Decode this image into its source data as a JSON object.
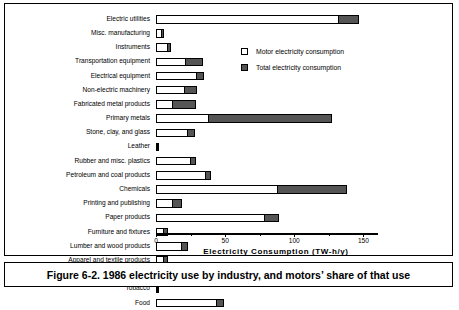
{
  "caption": "Figure 6-2. 1986 electricity use by industry, and motors’ share of that use",
  "legend": {
    "items": [
      {
        "label": "Motor electricity consumption",
        "swatch": "white-square",
        "color": "#ffffff"
      },
      {
        "label": "Total electricity consumption",
        "swatch": "dark-square",
        "color": "#555555"
      }
    ]
  },
  "chart_data": {
    "type": "bar",
    "orientation": "horizontal",
    "title": "",
    "xlabel": "Electricity  Consumption  (TW-h/y)",
    "ylabel": "",
    "xlim": [
      0,
      160
    ],
    "xticks": [
      0,
      50,
      100,
      150
    ],
    "xticklabels": [
      "0",
      "50",
      "100",
      "150"
    ],
    "grid": false,
    "legend_position": "upper-right-inside",
    "categories": [
      "Electric utilities",
      "Misc. manufacturing",
      "Instruments",
      "Transportation equipment",
      "Electrical equipment",
      "Non-electric machinery",
      "Fabricated metal products",
      "Primary metals",
      "Stone, clay, and glass",
      "Leather",
      "Rubber and misc. plastics",
      "Petroleum and coal products",
      "Chemicals",
      "Printing and publishing",
      "Paper products",
      "Furniture and fixtures",
      "Lumber and wood products",
      "Apparel and textile products",
      "Textile mills",
      "Tobacco",
      "Food"
    ],
    "series": [
      {
        "name": "Motor electricity consumption",
        "values": [
          132,
          4,
          9,
          22,
          30,
          21,
          12,
          38,
          23,
          1.5,
          25,
          36,
          88,
          12,
          79,
          6,
          19,
          6,
          3.5,
          1.5,
          44
        ]
      },
      {
        "name": "Total electricity consumption",
        "values": [
          147,
          6,
          11,
          34,
          35,
          30,
          29,
          127,
          28,
          2.5,
          29,
          40,
          138,
          19,
          89,
          9,
          23,
          9,
          5,
          2.5,
          49
        ]
      }
    ],
    "units": "TW-h/y"
  },
  "axis": {
    "minor_ticks": [
      25,
      75,
      125
    ]
  }
}
